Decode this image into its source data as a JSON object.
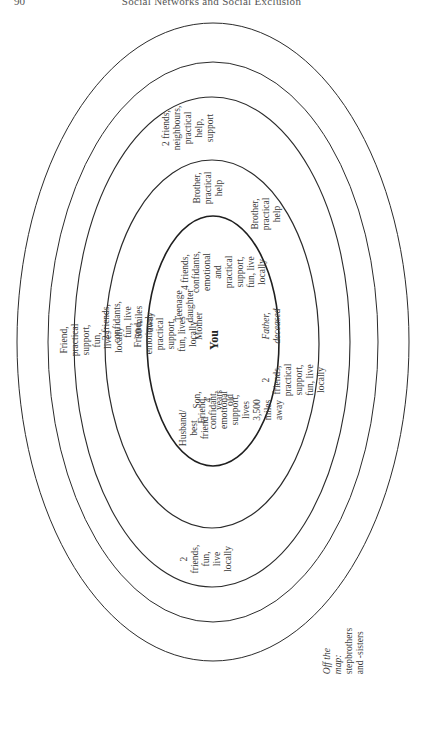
{
  "page": {
    "page_number": "90",
    "running_head": "Social Networks and Social Exclusion"
  },
  "diagram": {
    "type": "concentric personal community map",
    "orientation": "rotated 90 degrees counter-clockwise",
    "center_label": "You",
    "rings": [
      {
        "level": 1,
        "description": "innermost circle",
        "members": [
          "Friend, emotional, practical\nsupport, fun, lives locally",
          "Teenage daughter",
          "Mother",
          "Son, 4 years old",
          "Husband/\nbest friend",
          "Friend, confidant,\nemotional support, lives\n3,500 miles away",
          "4 friends,\nconfidants,\nemotional and\npractical support,\nfun, live locally",
          "Brother,\npractical\nhelp"
        ]
      },
      {
        "level": 2,
        "members": [
          "2 friends, confidants,\nfun, live 50 miles away",
          "Brother,\npractical\nhelp",
          "Father, deceased",
          "2 friends, practical support,\nfun, live locally",
          "2 friends,\nfun, live\nlocally"
        ]
      },
      {
        "level": 3,
        "members": [
          "Friend, practical support, fun,\nlives locally",
          "2 friends,\nneighbours,\npractical help,\nsupport"
        ]
      },
      {
        "level": 4,
        "members": []
      },
      {
        "level": 5,
        "members": []
      }
    ],
    "labels": {
      "friend_practical_fun": "Friend, practical support, fun,\nlives locally",
      "two_friends_confidants": "2 friends, confidants,\nfun, live 50 miles away",
      "friend_emotional_practical": "Friend, emotional, practical\nsupport, fun, lives locally",
      "teenage_daughter": "Teenage daughter",
      "mother": "Mother",
      "you": "You",
      "son": "Son, 4 years old",
      "husband": "Husband/\nbest friend",
      "friend_confidant_far": "Friend, confidant,\nemotional support, lives\n3,500 miles away",
      "four_friends": "4 friends,\nconfidants,\nemotional and\npractical support,\nfun, live locally",
      "father": "Father, deceased",
      "brother_inner": "Brother,\npractical\nhelp",
      "brother_outer": "Brother,\npractical\nhelp",
      "two_friends_neighbours": "2 friends,\nneighbours,\npractical help,\nsupport",
      "two_friends_practical": "2 friends, practical support,\nfun, live locally",
      "two_friends_fun": "2 friends,\nfun, live\nlocally",
      "off_map_prefix": "Off the map:",
      "off_map_text": " stepbrothers\nand -sisters"
    },
    "colors": {
      "line": "#2b2b2b",
      "text": "#3a3a3a",
      "background": "#ffffff"
    }
  }
}
